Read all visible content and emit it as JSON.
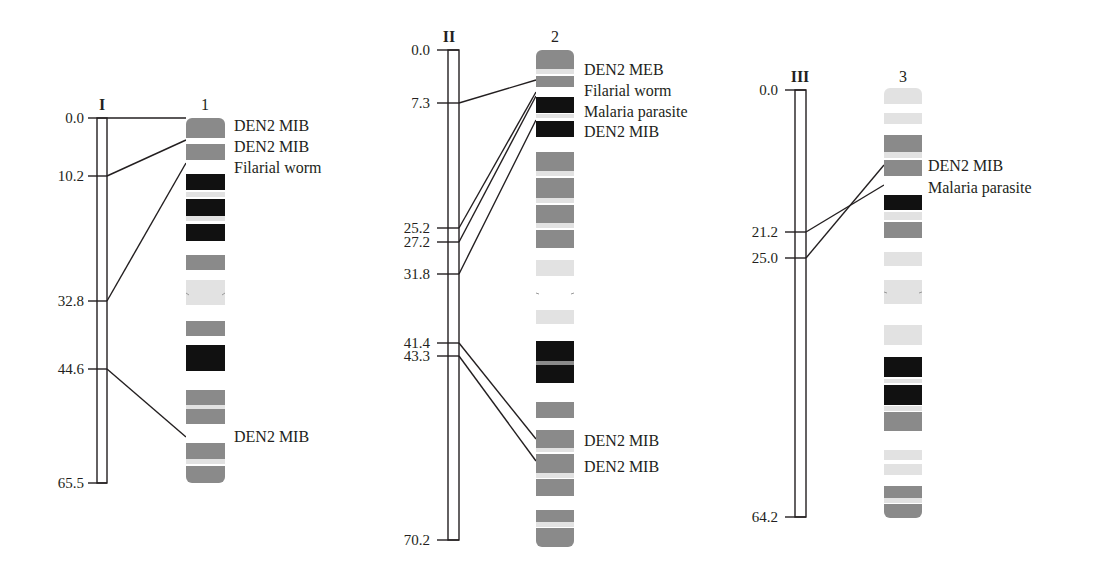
{
  "colors": {
    "line": "#231f20",
    "band_dark": "#111111",
    "band_gray": "#8a8a8a",
    "band_light": "#e2e2e2",
    "band_white": "#ffffff"
  },
  "linkage_groups": [
    {
      "id": "I",
      "chromosome": "1",
      "scale": {
        "min": 0.0,
        "max": 65.5
      },
      "ticks": [
        "0.0",
        "10.2",
        "32.8",
        "44.6",
        "65.5"
      ],
      "loci": [
        {
          "pos": "0.0",
          "label": "DEN2 MIB"
        },
        {
          "pos": "10.2",
          "label": "DEN2 MIB"
        },
        {
          "pos": "32.8",
          "label": "Filarial worm"
        },
        {
          "pos": "44.6",
          "label": "DEN2 MIB"
        }
      ]
    },
    {
      "id": "II",
      "chromosome": "2",
      "scale": {
        "min": 0.0,
        "max": 70.2
      },
      "ticks": [
        "0.0",
        "7.3",
        "25.2",
        "27.2",
        "31.8",
        "41.4",
        "43.3",
        "70.2"
      ],
      "loci": [
        {
          "pos": "7.3",
          "label": "DEN2 MEB"
        },
        {
          "pos": "25.2",
          "label": "Filarial worm"
        },
        {
          "pos": "27.2",
          "label": "Malaria parasite"
        },
        {
          "pos": "31.8",
          "label": "DEN2 MIB"
        },
        {
          "pos": "41.4",
          "label": "DEN2 MIB"
        },
        {
          "pos": "43.3",
          "label": "DEN2 MIB"
        }
      ]
    },
    {
      "id": "III",
      "chromosome": "3",
      "scale": {
        "min": 0.0,
        "max": 64.2
      },
      "ticks": [
        "0.0",
        "21.2",
        "25.0",
        "64.2"
      ],
      "loci": [
        {
          "pos": "21.2",
          "label": "Malaria parasite"
        },
        {
          "pos": "25.0",
          "label": "DEN2 MIB"
        }
      ]
    }
  ],
  "labels": {
    "chr1": [
      "DEN2 MIB",
      "DEN2 MIB",
      "Filarial worm",
      "DEN2 MIB"
    ],
    "chr2": [
      "DEN2 MEB",
      "Filarial worm",
      "Malaria parasite",
      "DEN2 MIB",
      "DEN2 MIB",
      "DEN2 MIB"
    ],
    "chr3": [
      "DEN2 MIB",
      "Malaria parasite"
    ]
  }
}
